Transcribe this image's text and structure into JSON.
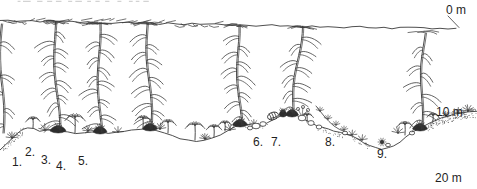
{
  "figure": {
    "type": "kelp-forest-depth-cross-section",
    "background": "#ffffff",
    "ink_color": "#3a3a3a",
    "holdfast_color": "#2d2d2d",
    "label_color": "#1f1f1f",
    "remnant_color": "#c9c9c9",
    "depth_markers": {
      "surface": "0 m",
      "mid": "10 m",
      "bottom": "20 m"
    },
    "specimen_labels": [
      "1.",
      "2.",
      "3.",
      "4.",
      "5.",
      "6.",
      "7.",
      "8.",
      "9."
    ]
  }
}
